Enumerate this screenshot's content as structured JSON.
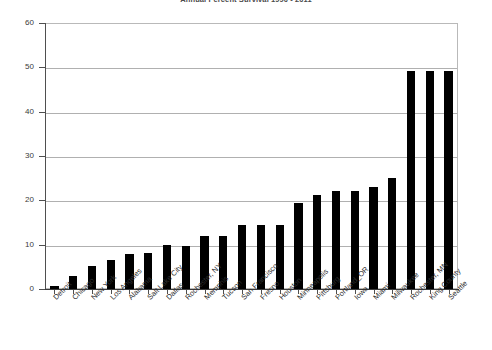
{
  "chart_data": {
    "type": "bar",
    "title": "Annual Percent Survival 1990 - 2011",
    "xlabel": "",
    "ylabel": "",
    "ylim": [
      0,
      60
    ],
    "yticks": [
      0,
      10,
      20,
      30,
      40,
      50,
      60
    ],
    "grid": true,
    "legend": false,
    "bar_color": "#000000",
    "categories": [
      "Detroit",
      "Chicago",
      "New York",
      "Los Angeles",
      "Alabama",
      "Salt Lake City",
      "Dallas",
      "Rochester, NY",
      "Memphis",
      "Tucson",
      "San Francisco",
      "Fresno",
      "Houston",
      "Minneapolis",
      "Pittsburg",
      "Portland_OR",
      "Iowa",
      "Miami",
      "Milwaukee",
      "Rochester, MN",
      "King County",
      "Seattle"
    ],
    "values": [
      0.6,
      3.0,
      5.2,
      6.6,
      7.8,
      8.2,
      10.0,
      9.8,
      11.9,
      11.9,
      14.5,
      14.5,
      14.5,
      19.5,
      21.3,
      22.2,
      22.2,
      23.0,
      25.1,
      49.2,
      49.2,
      49.2
    ]
  },
  "axis": {
    "y_tick_labels": [
      "60",
      "50",
      "40",
      "30",
      "20",
      "10",
      "0"
    ]
  }
}
